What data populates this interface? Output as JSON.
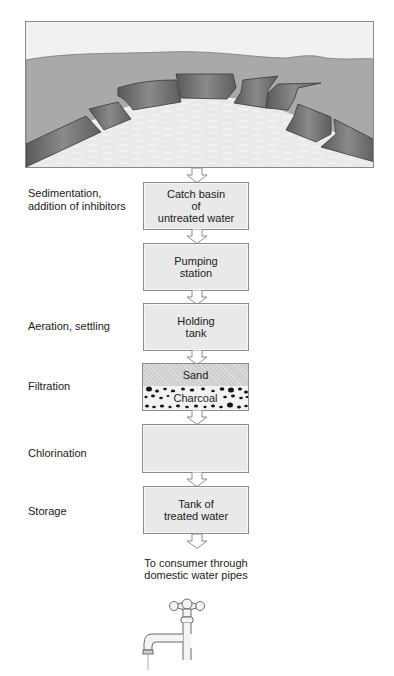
{
  "illustration": {
    "subject": "reservoir-catch-basin",
    "colors": {
      "sky": "#f0f0f0",
      "land": "#a8a8a8",
      "dam_wall": "#6e6e6e",
      "water": "#ececec",
      "frame": "#8a8a8a"
    }
  },
  "stages": [
    {
      "id": "catch-basin",
      "label": "Sedimentation,\naddition of inhibitors",
      "label_lines": [
        "Sedimentation,",
        "addition of inhibitors"
      ],
      "box_lines": [
        "Catch basin",
        "of",
        "untreated water"
      ]
    },
    {
      "id": "pumping",
      "label": "",
      "label_lines": [],
      "box_lines": [
        "Pumping",
        "station"
      ]
    },
    {
      "id": "holding",
      "label": "Aeration, settling",
      "label_lines": [
        "Aeration, settling"
      ],
      "box_lines": [
        "Holding",
        "tank"
      ]
    },
    {
      "id": "filter",
      "label": "Filtration",
      "label_lines": [
        "Filtration"
      ],
      "layers": [
        "Sand",
        "Charcoal"
      ]
    },
    {
      "id": "chlorination",
      "label": "Chlorination",
      "label_lines": [
        "Chlorination"
      ],
      "box_lines": []
    },
    {
      "id": "storage",
      "label": "Storage",
      "label_lines": [
        "Storage"
      ],
      "box_lines": [
        "Tank of",
        "treated water"
      ]
    }
  ],
  "consumer": {
    "lines": [
      "To consumer through",
      "domestic water pipes"
    ],
    "icon": "faucet-icon"
  },
  "colors": {
    "box_fill": "#e9e9e9",
    "box_border": "#8c8c8c",
    "arrow_fill": "#ffffff",
    "arrow_stroke": "#8c8c8c",
    "text": "#1a1a1a"
  }
}
